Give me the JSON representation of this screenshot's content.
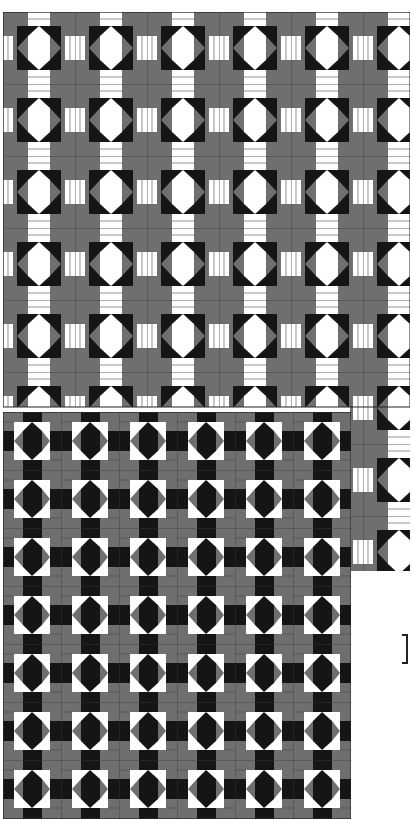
{
  "image": {
    "description": "Two geometric quilt-block pattern swatches",
    "colors": {
      "gray": "#6f6f6f",
      "black": "#151515",
      "white": "#ffffff",
      "grid_line": "#3a3a3a"
    },
    "top_swatch": {
      "tile_size_px": 72,
      "motif": "white octagon with gray side triangles and black corners on gray grid"
    },
    "bottom_swatch": {
      "tile_size_px": 58,
      "motif": "black octagon with gray side triangles and white corners on gray grid"
    },
    "annotation": {
      "bracket": "]"
    }
  }
}
